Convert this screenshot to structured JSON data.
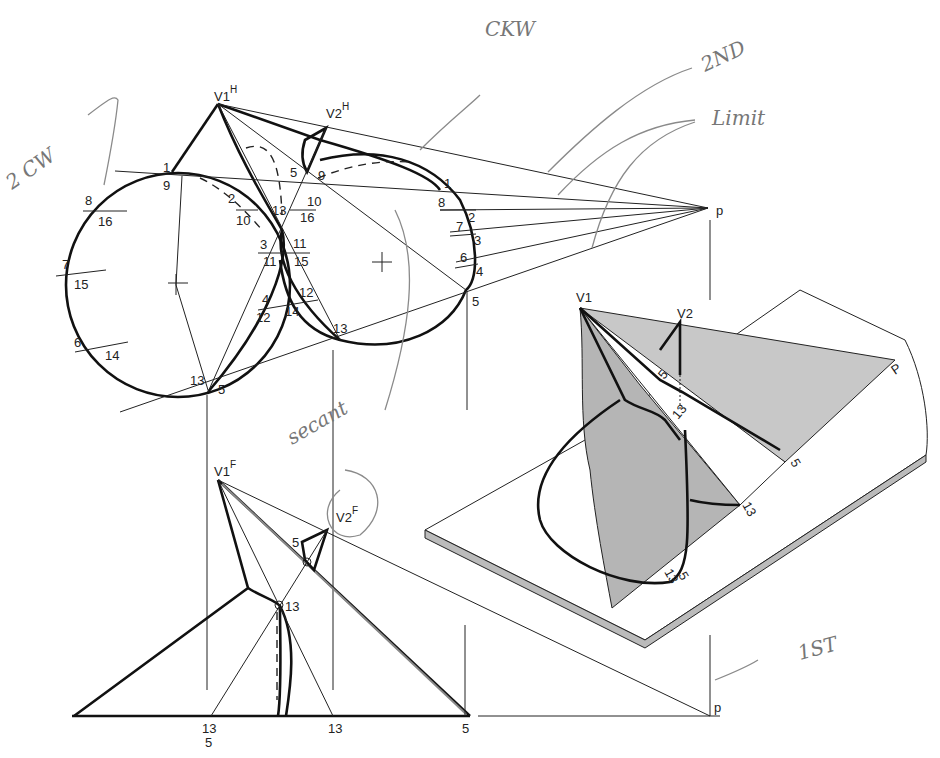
{
  "figure": {
    "views": {
      "top": {
        "apex1": "V1",
        "apex1_sup": "H",
        "apex2": "V2",
        "apex2_sup": "H",
        "point_p": "p",
        "left_base_labels": [
          {
            "top": "1",
            "bottom": "9"
          },
          {
            "top": "8",
            "bottom": "16"
          },
          {
            "top": "7",
            "bottom": "15"
          },
          {
            "top": "6",
            "bottom": "14"
          },
          {
            "top": "13",
            "bottom": "5"
          }
        ],
        "center_labels": [
          {
            "top": "2",
            "bottom": "10"
          },
          {
            "top": "13",
            "bottom": ""
          },
          {
            "top": "10",
            "bottom": "16"
          },
          {
            "top": "3",
            "bottom": "11"
          },
          {
            "top": "11",
            "bottom": "15"
          },
          {
            "top": "4",
            "bottom": "12"
          },
          {
            "top": "12",
            "bottom": "14"
          },
          {
            "top": "5",
            "bottom": "9"
          },
          {
            "top": "13",
            "bottom": ""
          }
        ],
        "right_base_labels": [
          "1",
          "8",
          "2",
          "7",
          "3",
          "6",
          "4",
          "5"
        ]
      },
      "front": {
        "apex1": "V1",
        "apex1_sup": "F",
        "apex2": "V2",
        "apex2_sup": "F",
        "point_p": "p",
        "labels": [
          "5",
          "13"
        ],
        "base_labels": [
          {
            "top": "13",
            "bottom": "5"
          },
          {
            "top": "13",
            "bottom": ""
          },
          {
            "top": "5",
            "bottom": ""
          }
        ]
      },
      "pictorial": {
        "apex1": "V1",
        "apex2": "V2",
        "point_p": "P",
        "labels": [
          "5",
          "13",
          "5",
          "13",
          "13",
          "5"
        ]
      }
    },
    "annotations": {
      "ckw": "CKW",
      "second": "2ND",
      "limit": "Limit",
      "two_cw": "2 CW",
      "secant": "secant",
      "first": "1ST"
    },
    "colors": {
      "ink": "#111111",
      "pencil": "#8a8a8a",
      "shade": "#c8c8c8",
      "paper": "#ffffff"
    }
  }
}
